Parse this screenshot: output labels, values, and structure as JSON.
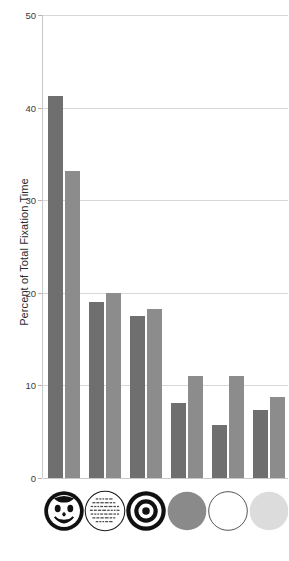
{
  "chart_data": {
    "type": "bar",
    "title": "",
    "xlabel": "",
    "ylabel": "Percent of Total Fixation Time",
    "ylim": [
      0,
      50
    ],
    "yticks": [
      0,
      10,
      20,
      30,
      40,
      50
    ],
    "ytick_labels": [
      "0",
      "10",
      "20",
      "30",
      "40",
      "50"
    ],
    "grid": true,
    "legend": "none",
    "categories": [
      "face",
      "text-circle",
      "bullseye",
      "gray-circle",
      "white-circle",
      "light-gray-circle"
    ],
    "series": [
      {
        "name": "series-a",
        "color": "#6f6f6f",
        "values": [
          41.3,
          19.0,
          17.5,
          8.1,
          5.7,
          7.3
        ]
      },
      {
        "name": "series-b",
        "color": "#8c8c8c",
        "values": [
          33.2,
          20.0,
          18.3,
          11.0,
          11.0,
          8.7
        ]
      }
    ]
  },
  "axis": {
    "y_title": "Percent of Total Fixation Time",
    "tick_0": "0",
    "tick_10": "10",
    "tick_20": "20",
    "tick_30": "30",
    "tick_40": "40",
    "tick_50": "50"
  },
  "icons": [
    {
      "name": "smiley-face-icon",
      "label": "face"
    },
    {
      "name": "text-circle-icon",
      "label": "text"
    },
    {
      "name": "bullseye-icon",
      "label": "bullseye"
    },
    {
      "name": "gray-circle-icon",
      "label": "gray circle",
      "color": "#8a8a8a"
    },
    {
      "name": "white-circle-icon",
      "label": "white circle",
      "color": "#ffffff"
    },
    {
      "name": "light-gray-circle-icon",
      "label": "light gray circle",
      "color": "#dcdcdc"
    }
  ],
  "colors": {
    "series_a": "#6f6f6f",
    "series_b": "#8c8c8c",
    "gridline": "#d8d8d8",
    "axis": "#c9c9c9",
    "text": "#2b2b2b"
  }
}
